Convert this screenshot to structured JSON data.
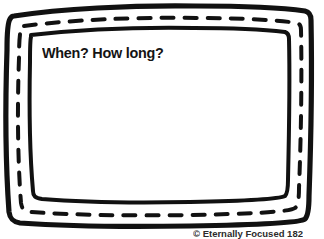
{
  "page": {
    "type": "worksheet-label-frame",
    "background_color": "#ffffff",
    "ink_color": "#111111",
    "width": 324,
    "height": 239
  },
  "frame": {
    "style": "hand-drawn-doodle",
    "layers": [
      {
        "name": "outer-border",
        "stroke": "#111111",
        "stroke_width": 5
      },
      {
        "name": "dashed-band",
        "stroke": "#111111",
        "stroke_width": 4,
        "dashed": true
      },
      {
        "name": "inner-border",
        "stroke": "#111111",
        "stroke_width": 4
      }
    ]
  },
  "content": {
    "prompt": "When? How long?"
  },
  "footer": {
    "credit": "© Eternally Focused 182"
  }
}
